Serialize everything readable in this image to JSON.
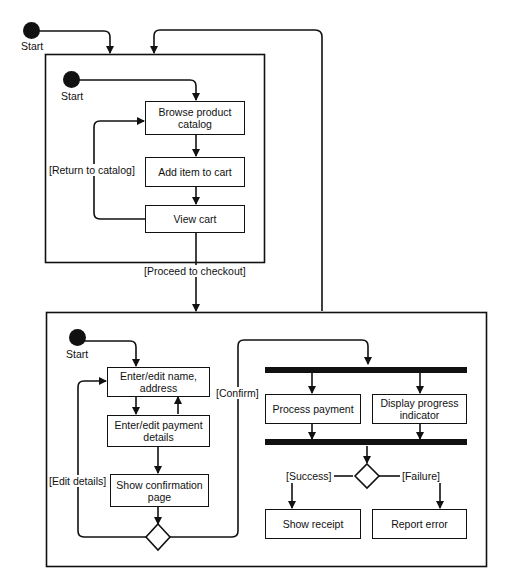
{
  "diagram": {
    "type": "UML activity diagram",
    "start_label": "Start",
    "browse_phase": {
      "start_label": "Start",
      "activities": {
        "browse": "Browse product\ncatalog",
        "add": "Add item to cart",
        "view": "View cart"
      },
      "guards": {
        "return": "[Return to catalog]",
        "proceed": "[Proceed to checkout]"
      }
    },
    "checkout_phase": {
      "start_label": "Start",
      "activities": {
        "name": "Enter/edit name,\naddress",
        "payment": "Enter/edit payment\ndetails",
        "confirm_page": "Show confirmation\npage",
        "process": "Process payment",
        "progress": "Display progress\nindicator",
        "receipt": "Show receipt",
        "error": "Report error"
      },
      "guards": {
        "edit": "[Edit details]",
        "confirm": "[Confirm]",
        "success": "[Success]",
        "failure": "[Failure]"
      }
    }
  }
}
